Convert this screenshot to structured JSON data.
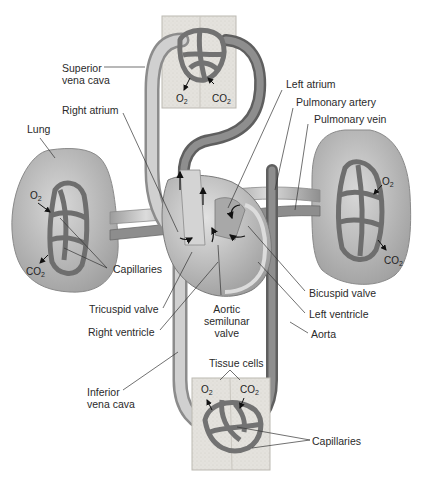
{
  "labels": {
    "superior_vena_cava": [
      "Superior",
      "vena cava"
    ],
    "right_atrium": "Right atrium",
    "lung": "Lung",
    "left_atrium": "Left atrium",
    "pulmonary_artery": "Pulmonary artery",
    "pulmonary_vein": "Pulmonary vein",
    "capillaries_lung": "Capillaries",
    "tricuspid_valve": "Tricuspid valve",
    "right_ventricle": "Right ventricle",
    "aortic_semilunar_valve": [
      "Aortic",
      "semilunar",
      "valve"
    ],
    "bicuspid_valve": "Bicuspid valve",
    "left_ventricle": "Left ventricle",
    "aorta": "Aorta",
    "inferior_vena_cava": [
      "Inferior",
      "vena cava"
    ],
    "tissue_cells": "Tissue cells",
    "capillaries_tissue": "Capillaries"
  },
  "gases": {
    "o2": "O",
    "co2": "CO",
    "subscript": "2"
  },
  "colors": {
    "vessel_fill": "#c9c9c9",
    "vessel_dark": "#6f6f6f",
    "capillary": "#7b7b7b",
    "tissue": "#e6e4df",
    "lung": "#b9b9b9",
    "heart": "#bdbdbd",
    "leader_line": "#333333"
  }
}
